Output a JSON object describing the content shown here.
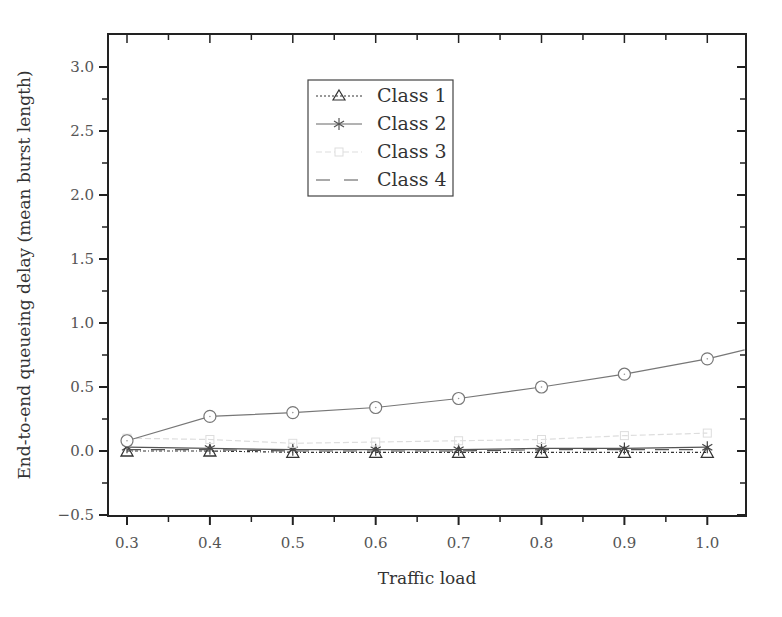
{
  "chart_data": {
    "type": "line",
    "title": "",
    "xlabel": "Traffic load",
    "ylabel": "End-to-end queueing delay (mean burst length)",
    "xlim": [
      0.275,
      1.045
    ],
    "ylim": [
      -0.5,
      3.25
    ],
    "xticks": [
      "0.3",
      "0.4",
      "0.5",
      "0.6",
      "0.7",
      "0.8",
      "0.9",
      "1.0"
    ],
    "yticks": [
      "−0.5",
      "0.0",
      "0.5",
      "1.0",
      "1.5",
      "2.0",
      "2.5",
      "3.0"
    ],
    "grid": false,
    "legend_position": "upper center",
    "x": [
      0.3,
      0.4,
      0.5,
      0.6,
      0.7,
      0.8,
      0.9,
      1.0
    ],
    "series": [
      {
        "name": "Class 1",
        "marker": "triangle",
        "line": "dash-dot",
        "color": "#333333",
        "values": [
          0.0,
          0.0,
          -0.01,
          -0.01,
          -0.01,
          -0.01,
          -0.01,
          -0.01
        ]
      },
      {
        "name": "Class 2",
        "marker": "asterisk",
        "line": "solid",
        "color": "#555555",
        "values": [
          0.03,
          0.02,
          0.01,
          0.01,
          0.01,
          0.02,
          0.02,
          0.03
        ]
      },
      {
        "name": "Class 3",
        "marker": "square",
        "line": "dashed",
        "color": "#dddddd",
        "values": [
          0.1,
          0.09,
          0.06,
          0.07,
          0.08,
          0.09,
          0.12,
          0.14
        ]
      },
      {
        "name": "Class 4",
        "marker": "none",
        "line": "long-dash",
        "color": "#555555",
        "values": [
          0.01,
          0.01,
          0.0,
          0.0,
          0.0,
          0.01,
          0.01,
          0.01
        ]
      },
      {
        "name": "",
        "marker": "circle",
        "line": "solid",
        "color": "#777777",
        "values": [
          0.08,
          0.27,
          0.3,
          0.34,
          0.41,
          0.5,
          0.6,
          0.72
        ],
        "extends_to": {
          "x": 1.045,
          "y": 0.79
        }
      }
    ]
  },
  "legend": {
    "items": [
      {
        "label": "Class 1"
      },
      {
        "label": "Class 2"
      },
      {
        "label": "Class 3"
      },
      {
        "label": "Class 4"
      }
    ]
  }
}
